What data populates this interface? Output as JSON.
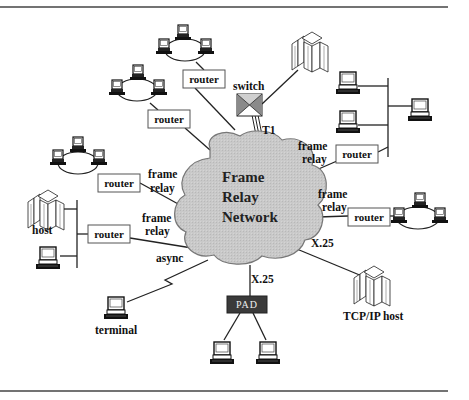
{
  "diagram": {
    "colors": {
      "cloud_fill": "#c8c8c8",
      "cloud_stroke": "#777777",
      "pad_fill": "#3a3a3a",
      "line": "#222222",
      "border_rule": "#444444"
    },
    "cloud": {
      "label_lines": [
        "Frame",
        "Relay",
        "Network"
      ]
    },
    "switch": {
      "label": "switch",
      "link_label": "T1"
    },
    "pad": {
      "label": "PAD",
      "link_label": "X.25"
    },
    "routers": [
      {
        "id": "router-top-1",
        "label": "router"
      },
      {
        "id": "router-top-2",
        "label": "router"
      },
      {
        "id": "router-left-1",
        "label": "router",
        "link_label": [
          "frame",
          "relay"
        ]
      },
      {
        "id": "router-left-2",
        "label": "router",
        "link_label": [
          "frame",
          "relay"
        ]
      },
      {
        "id": "router-right-1",
        "label": "router",
        "link_label": [
          "frame",
          "relay"
        ]
      },
      {
        "id": "router-right-2",
        "label": "router",
        "link_label": [
          "frame",
          "relay"
        ]
      }
    ],
    "labels": {
      "host": "host",
      "terminal": "terminal",
      "async": "async",
      "tcpip_host": "TCP/IP host",
      "x25_right": "X.25"
    }
  }
}
